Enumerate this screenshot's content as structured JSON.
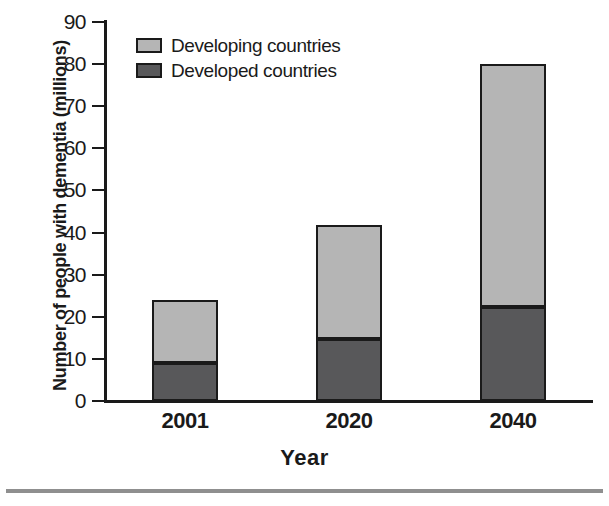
{
  "chart_data": {
    "type": "bar",
    "subtype": "stacked-bar",
    "title": "",
    "xlabel": "Year",
    "ylabel": "Number of people with dementia (millions)",
    "categories": [
      "2001",
      "2020",
      "2040"
    ],
    "series": [
      {
        "name": "Developed countries",
        "color": "#58585a",
        "values": [
          9,
          14.8,
          22.4
        ]
      },
      {
        "name": "Developing countries",
        "color": "#b5b5b5",
        "values": [
          15,
          26.9,
          57.6
        ]
      }
    ],
    "totals": [
      24,
      41.7,
      80
    ],
    "ylim": [
      0,
      90
    ],
    "yticks": [
      0,
      10,
      20,
      30,
      40,
      50,
      60,
      70,
      80,
      90
    ],
    "ytick_labels": [
      "0",
      "10",
      "20",
      "30",
      "40",
      "50",
      "60",
      "70",
      "80",
      "90"
    ],
    "grid": false,
    "legend_position": "top-left-inside",
    "legend_entries": [
      "Developing countries",
      "Developed countries"
    ]
  },
  "axes": {
    "y_title": "Number of people with dementia (millions)",
    "x_title": "Year"
  },
  "legend": {
    "items": [
      {
        "label": "Developing countries",
        "color": "#b5b5b5"
      },
      {
        "label": "Developed countries",
        "color": "#58585a"
      }
    ]
  },
  "colors": {
    "developing": "#b5b5b5",
    "developed": "#58585a",
    "axis": "#1a1a1a",
    "rule": "#8f8f8f",
    "background": "#ffffff"
  }
}
